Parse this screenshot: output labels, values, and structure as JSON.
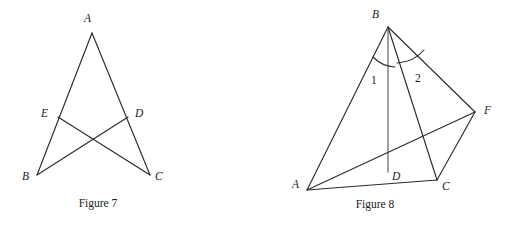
{
  "page": {
    "background_color": "#ffffff",
    "stroke_color": "#2b2b2b",
    "accent_stroke_color": "#6e6e6e",
    "width": 518,
    "height": 227
  },
  "figures": [
    {
      "id": "figure-7",
      "caption": "Figure 7",
      "caption_x": 98,
      "caption_y": 207,
      "vertices": [
        {
          "name": "A",
          "label": "A",
          "x": 92,
          "y": 33,
          "label_x": 84,
          "label_y": 22
        },
        {
          "name": "E",
          "label": "E",
          "x": 58,
          "y": 117,
          "label_x": 41,
          "label_y": 117
        },
        {
          "name": "D",
          "label": "D",
          "x": 128,
          "y": 117,
          "label_x": 135,
          "label_y": 117
        },
        {
          "name": "B",
          "label": "B",
          "x": 37,
          "y": 175,
          "label_x": 22,
          "label_y": 180
        },
        {
          "name": "C",
          "label": "C",
          "x": 150,
          "y": 175,
          "label_x": 155,
          "label_y": 180
        }
      ],
      "segments": [
        {
          "name": "segment-AB",
          "from": "A",
          "to": "B",
          "style": "dark"
        },
        {
          "name": "segment-AC",
          "from": "A",
          "to": "C",
          "style": "dark"
        },
        {
          "name": "segment-BC-cross-ED",
          "from": "E",
          "to": "C",
          "style": "dark"
        },
        {
          "name": "segment-DB",
          "from": "D",
          "to": "B",
          "style": "dark"
        }
      ]
    },
    {
      "id": "figure-8",
      "caption": "Figure 8",
      "caption_x": 375,
      "caption_y": 208,
      "vertices": [
        {
          "name": "B",
          "label": "B",
          "x": 388,
          "y": 27,
          "label_x": 372,
          "label_y": 18
        },
        {
          "name": "A",
          "label": "A",
          "x": 307,
          "y": 190,
          "label_x": 292,
          "label_y": 188
        },
        {
          "name": "D",
          "label": "D",
          "x": 388,
          "y": 172,
          "label_x": 392,
          "label_y": 180
        },
        {
          "name": "C",
          "label": "C",
          "x": 437,
          "y": 180,
          "label_x": 442,
          "label_y": 190
        },
        {
          "name": "F",
          "label": "F",
          "x": 475,
          "y": 112,
          "label_x": 484,
          "label_y": 114
        }
      ],
      "segments": [
        {
          "name": "segment-BA",
          "from": "B",
          "to": "A",
          "style": "dark"
        },
        {
          "name": "segment-BD",
          "from": "B",
          "to": "D",
          "style": "grey"
        },
        {
          "name": "segment-BC",
          "from": "B",
          "to": "C",
          "style": "dark"
        },
        {
          "name": "segment-BF",
          "from": "B",
          "to": "F",
          "style": "dark"
        },
        {
          "name": "segment-AD-F",
          "from": "A",
          "to": "F",
          "style": "dark"
        },
        {
          "name": "segment-AC",
          "from": "A",
          "to": "C",
          "style": "dark"
        },
        {
          "name": "segment-CF",
          "from": "C",
          "to": "F",
          "style": "dark"
        }
      ],
      "angles": [
        {
          "name": "angle-1",
          "label": "1",
          "label_x": 371,
          "label_y": 84,
          "between": [
            "BA",
            "BD"
          ]
        },
        {
          "name": "angle-2",
          "label": "2",
          "label_x": 415,
          "label_y": 82,
          "between": [
            "BC",
            "BF"
          ]
        }
      ]
    }
  ]
}
